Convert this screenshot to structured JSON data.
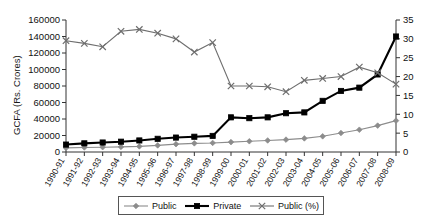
{
  "chart_data": {
    "type": "line",
    "title": "",
    "xlabel": "",
    "ylabel": "GCFA (Rs. Crores)",
    "y2label": "",
    "grid": false,
    "legend_position": "bottom",
    "categories": [
      "1990-91",
      "1991-92",
      "1992-93",
      "1993-94",
      "1994-95",
      "1995-96",
      "1996-97",
      "1997-98",
      "1998-99",
      "1999-00",
      "2000-01",
      "2001-02",
      "2002-03",
      "2003-04",
      "2004-05",
      "2005-06",
      "2006-07",
      "2007-08",
      "2008-09"
    ],
    "ylim": [
      0,
      160000
    ],
    "yticks": [
      0,
      20000,
      40000,
      60000,
      80000,
      100000,
      120000,
      140000,
      160000
    ],
    "ytick_labels": [
      "0",
      "20000",
      "40000",
      "60000",
      "80000",
      "100000",
      "120000",
      "140000",
      "160000"
    ],
    "y2lim": [
      0,
      35
    ],
    "y2ticks": [
      0,
      5,
      10,
      15,
      20,
      25,
      30,
      35
    ],
    "y2tick_labels": [
      "0",
      "5",
      "10",
      "15",
      "20",
      "25",
      "30",
      "35"
    ],
    "series": [
      {
        "name": "Public",
        "axis": "left",
        "marker": "diamond",
        "color": "#8c8c8c",
        "values": [
          5000,
          5500,
          5800,
          6200,
          6800,
          8000,
          9500,
          10500,
          11000,
          12000,
          13000,
          14000,
          15000,
          16500,
          19000,
          23000,
          27000,
          32000,
          38000
        ]
      },
      {
        "name": "Private",
        "axis": "left",
        "marker": "square",
        "color": "#000000",
        "values": [
          9000,
          10500,
          11500,
          12500,
          14000,
          16000,
          17500,
          18500,
          19500,
          42000,
          41000,
          42000,
          47000,
          48000,
          62000,
          74000,
          78000,
          94000,
          140000
        ]
      },
      {
        "name": "Public (%)",
        "axis": "right",
        "marker": "x",
        "color": "#6e6e6e",
        "values": [
          29.5,
          28.8,
          27.9,
          32.0,
          32.5,
          31.5,
          30.0,
          26.5,
          29.0,
          17.5,
          17.5,
          17.3,
          16.0,
          19.0,
          19.5,
          20.0,
          22.5,
          21.0,
          18.0
        ]
      }
    ]
  },
  "legend": {
    "items": [
      {
        "label": "Public",
        "marker": "diamond",
        "color": "#8c8c8c"
      },
      {
        "label": "Private",
        "marker": "square",
        "color": "#000000"
      },
      {
        "label": "Public (%)",
        "marker": "x",
        "color": "#6e6e6e"
      }
    ]
  }
}
